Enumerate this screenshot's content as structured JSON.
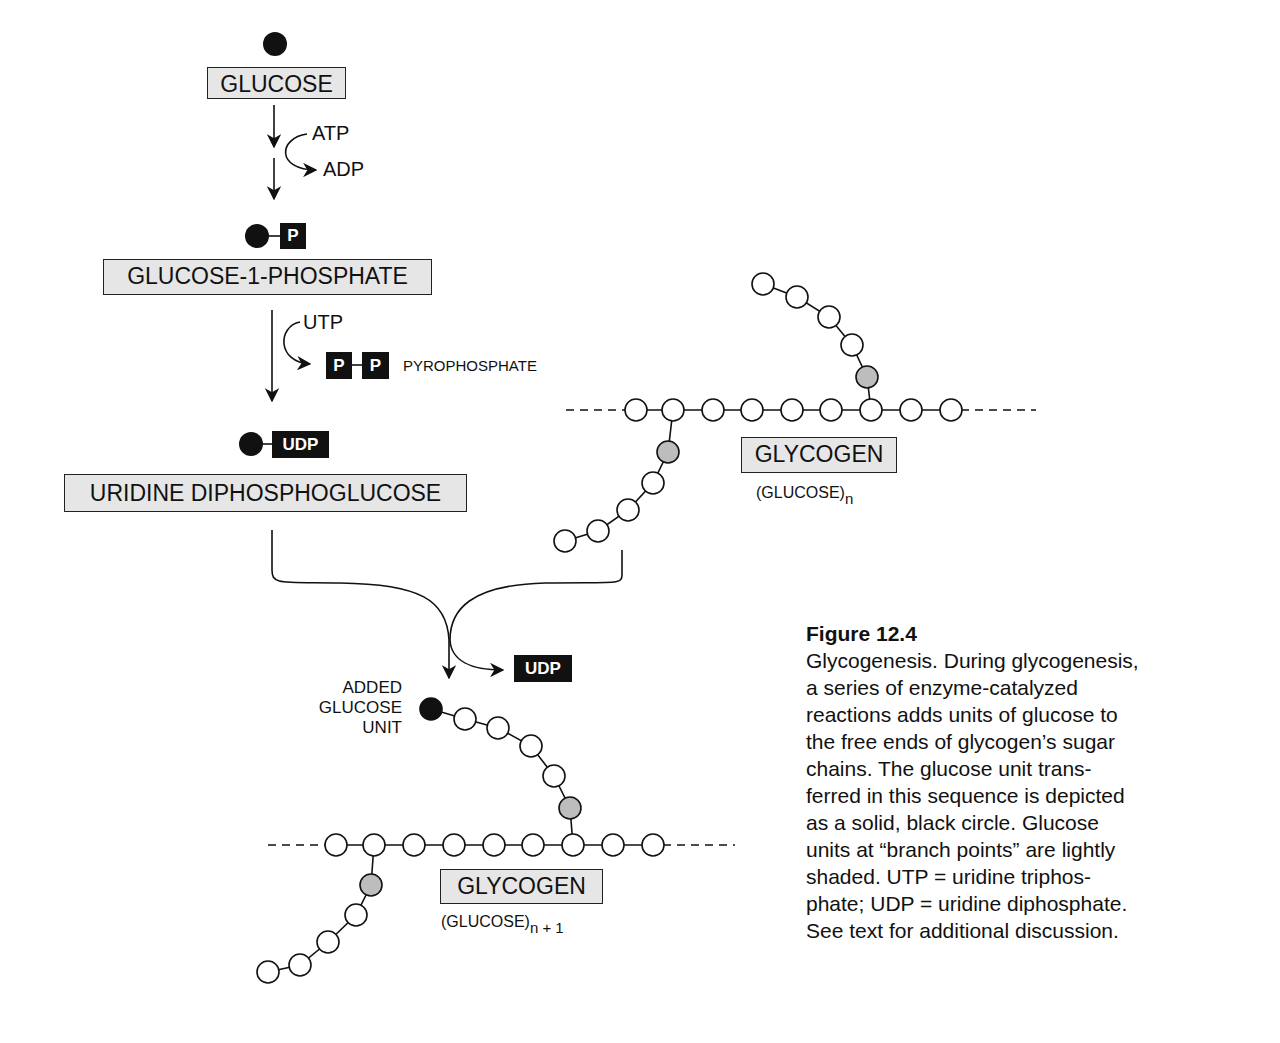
{
  "pathway": {
    "glucose": {
      "label": "GLUCOSE"
    },
    "step1": {
      "cofactor_in": "ATP",
      "cofactor_out": "ADP"
    },
    "glucose_1_phosphate": {
      "label": "GLUCOSE-1-PHOSPHATE",
      "tag": "P"
    },
    "step2": {
      "cofactor_in": "UTP",
      "product_tag_1": "P",
      "product_tag_2": "P",
      "product_label": "PYROPHOSPHATE"
    },
    "udp_glucose": {
      "label": "URIDINE DIPHOSPHOGLUCOSE",
      "tag": "UDP"
    },
    "step3": {
      "released": "UDP"
    }
  },
  "glycogen_before": {
    "label": "GLYCOGEN",
    "formula": "(GLUCOSE)",
    "subscript": "n"
  },
  "glycogen_after": {
    "label": "GLYCOGEN",
    "formula": "(GLUCOSE)",
    "subscript": "n + 1",
    "added_unit_label": [
      "ADDED",
      "GLUCOSE",
      "UNIT"
    ]
  },
  "caption": {
    "title": "Figure 12.4",
    "lines": [
      "Glycogenesis. During glycogenesis,",
      "a series of enzyme-catalyzed",
      "reactions adds units of glucose to",
      "the free ends of glycogen’s sugar",
      "chains. The glucose unit trans-",
      "ferred in this sequence is depicted",
      "as a solid, black circle. Glucose",
      "units at “branch points” are lightly",
      "shaded. UTP = uridine triphos-",
      "phate; UDP = uridine diphosphate.",
      "See text for additional discussion."
    ]
  },
  "legend": {
    "transferred_unit": "solid black circle",
    "branch_point": "lightly shaded circle",
    "glucose_unit": "open circle"
  },
  "colors": {
    "ink": "#111111",
    "box_fill": "#e6e6e6",
    "branch_fill": "#bdbdbd",
    "background": "#ffffff"
  }
}
